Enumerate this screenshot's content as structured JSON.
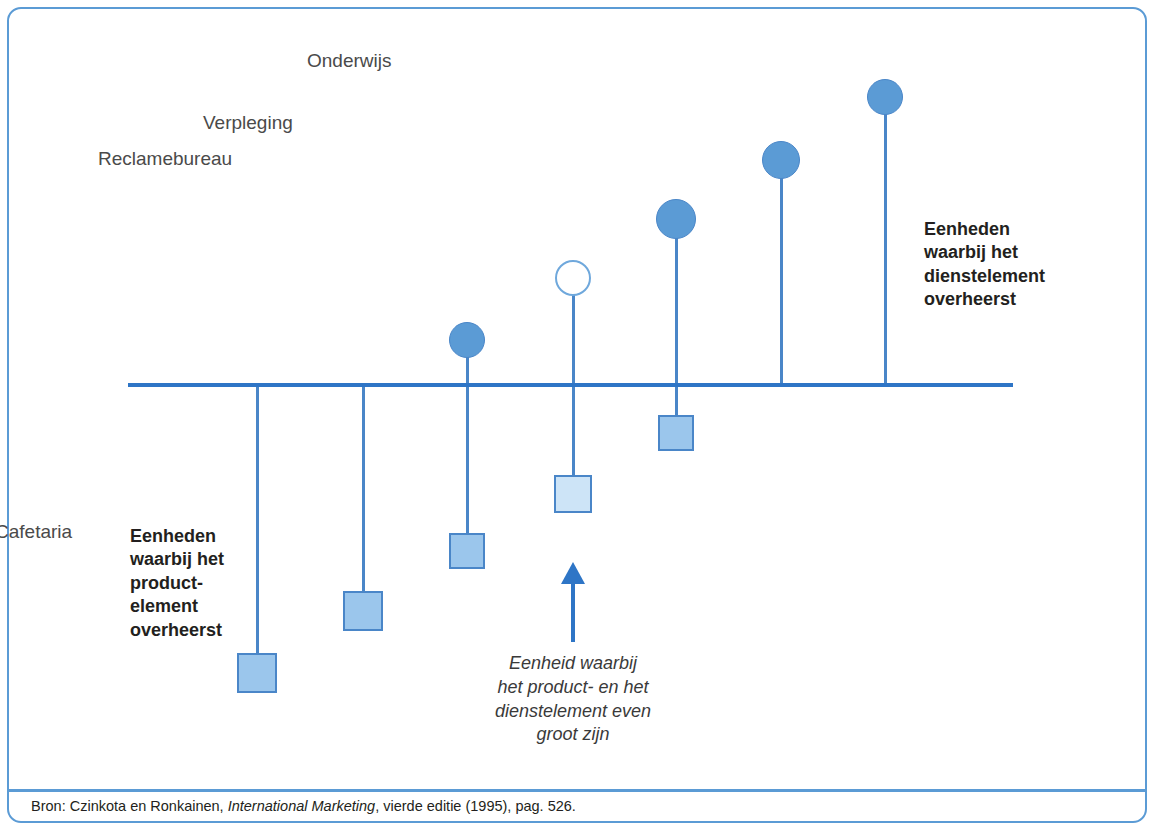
{
  "figure": {
    "axis": {
      "x_start": 128,
      "x_end": 1013,
      "y": 385
    },
    "left_note": "Eenheden\nwaarbij het\nproduct-\nelement\noverheerst",
    "right_note": "Eenheden\nwaarbij het\ndienstelement\noverheerst",
    "center_note": "Eenheid waarbij\nhet product- en het\ndienstelement even\ngroot zijn",
    "arrow_icon": "up-arrow-icon",
    "colors": {
      "frame": "#5B9BD5",
      "axis": "#2E75C6",
      "stem": "#4A86C8",
      "circle_fill": "#5B9BD5",
      "circle_hollow_fill": "#FFFFFF",
      "square_fill": "#9BC6EC",
      "square_light_fill": "#CDE4F7",
      "label_text": "#4A4A4A",
      "note_text": "#231F20"
    },
    "items": [
      {
        "label": "Zout",
        "x": 257,
        "circle": {
          "present": false,
          "style": "none",
          "cy": null,
          "d": 0
        },
        "square": {
          "present": true,
          "style": "mid",
          "size": 40,
          "top": 653
        },
        "label_y": 702,
        "stem_top": 385,
        "stem_bottom": 653
      },
      {
        "label": "Hondenvoer",
        "x": 363,
        "circle": {
          "present": false,
          "style": "none",
          "cy": null,
          "d": 0
        },
        "square": {
          "present": true,
          "style": "mid",
          "size": 40,
          "top": 591
        },
        "label_y": 641,
        "stem_top": 385,
        "stem_bottom": 591
      },
      {
        "label": "Auto",
        "x": 467,
        "circle": {
          "present": true,
          "style": "filled",
          "cy": 340,
          "d": 36
        },
        "square": {
          "present": true,
          "style": "mid",
          "size": 36,
          "top": 533
        },
        "label_y": 583,
        "stem_top": 340,
        "stem_bottom": 533
      },
      {
        "label": "Cafetaria",
        "x": 573,
        "circle": {
          "present": true,
          "style": "hollow",
          "cy": 278,
          "d": 36
        },
        "square": {
          "present": true,
          "style": "light",
          "size": 38,
          "top": 475
        },
        "label_y": 521,
        "stem_top": 278,
        "stem_bottom": 475
      },
      {
        "label": "Reclamebureau",
        "x": 676,
        "circle": {
          "present": true,
          "style": "filled",
          "cy": 219,
          "d": 40
        },
        "square": {
          "present": true,
          "style": "mid",
          "size": 36,
          "top": 415
        },
        "label_y": 148,
        "label_above": true,
        "stem_top": 219,
        "stem_bottom": 415
      },
      {
        "label": "Verpleging",
        "x": 781,
        "circle": {
          "present": true,
          "style": "filled",
          "cy": 160,
          "d": 38
        },
        "square": {
          "present": false,
          "style": "none",
          "size": 0,
          "top": null
        },
        "label_y": 112,
        "label_above": true,
        "stem_top": 160,
        "stem_bottom": 385
      },
      {
        "label": "Onderwijs",
        "x": 885,
        "circle": {
          "present": true,
          "style": "filled",
          "cy": 97,
          "d": 36
        },
        "square": {
          "present": false,
          "style": "none",
          "size": 0,
          "top": null
        },
        "label_y": 50,
        "label_above": true,
        "stem_top": 97,
        "stem_bottom": 385
      }
    ]
  },
  "source": {
    "prefix": "Bron: Czinkota en Ronkainen, ",
    "title": "International Marketing",
    "suffix": ", vierde editie (1995), pag. 526."
  },
  "chart_data": {
    "type": "scatter",
    "title": "",
    "xlabel": "",
    "ylabel": "",
    "categories": [
      "Zout",
      "Hondenvoer",
      "Auto",
      "Cafetaria",
      "Reclamebureau",
      "Verpleging",
      "Onderwijs"
    ],
    "series": [
      {
        "name": "Dienstelement (cirkel boven de as)",
        "values": [
          0,
          0,
          45,
          107,
          166,
          225,
          288
        ]
      },
      {
        "name": "Productelement (vierkant onder de as)",
        "values": [
          288,
          226,
          166,
          109,
          48,
          0,
          0
        ]
      }
    ],
    "notes": [
      "Eenheden waarbij het productelement overheerst (links)",
      "Eenheid waarbij het product- en het dienstelement even groot zijn (Cafetaria)",
      "Eenheden waarbij het dienstelement overheerst (rechts)"
    ]
  }
}
